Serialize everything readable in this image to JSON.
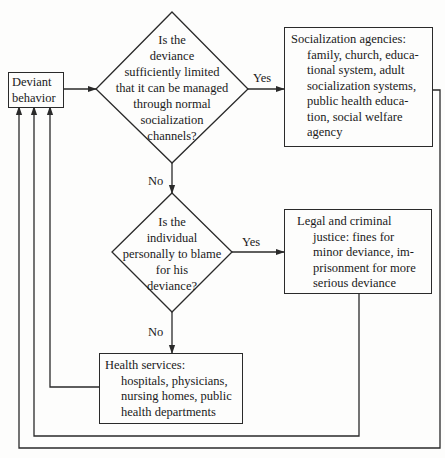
{
  "diagram": {
    "type": "flowchart",
    "start": {
      "id": "deviant",
      "lines": [
        "Deviant",
        "behavior"
      ]
    },
    "decisions": [
      {
        "id": "d1",
        "lines": [
          "Is the",
          "deviance",
          "sufficiently limited",
          "that it can be managed",
          "through normal",
          "socialization",
          "channels?"
        ]
      },
      {
        "id": "d2",
        "lines": [
          "Is the",
          "individual",
          "personally to blame",
          "for his",
          "deviance?"
        ]
      }
    ],
    "outcomes": [
      {
        "id": "socialization",
        "title": "Socialization agencies:",
        "body_lines": [
          "family, church, educa-",
          "tional system, adult",
          "socialization systems,",
          "public health educa-",
          "tion, social welfare",
          "agency"
        ]
      },
      {
        "id": "legal",
        "title": "Legal and criminal",
        "body_lines": [
          "justice: fines for",
          "minor deviance, im-",
          "prisonment for more",
          "serious deviance"
        ]
      },
      {
        "id": "health",
        "title": "Health services:",
        "body_lines": [
          "hospitals, physicians,",
          "nursing homes, public",
          "health departments"
        ]
      }
    ],
    "edge_labels": {
      "d1_yes": "Yes",
      "d1_no": "No",
      "d2_yes": "Yes",
      "d2_no": "No"
    },
    "edges": [
      {
        "from": "deviant",
        "to": "d1"
      },
      {
        "from": "d1",
        "to": "socialization",
        "label": "Yes"
      },
      {
        "from": "d1",
        "to": "d2",
        "label": "No"
      },
      {
        "from": "d2",
        "to": "legal",
        "label": "Yes"
      },
      {
        "from": "d2",
        "to": "health",
        "label": "No"
      },
      {
        "from": "health",
        "to": "deviant"
      },
      {
        "from": "legal",
        "to": "deviant"
      },
      {
        "from": "socialization",
        "to": "deviant"
      }
    ],
    "colors": {
      "line": "#2a2a2a",
      "text": "#1a1a1a",
      "background": "#fdfdfc"
    }
  }
}
